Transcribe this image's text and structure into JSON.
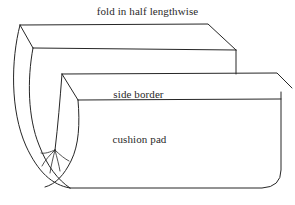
{
  "diagram": {
    "type": "line-illustration",
    "background_color": "#ffffff",
    "line_color": "#262626",
    "text_color": "#2a2a2a",
    "width": 295,
    "height": 205,
    "labels": {
      "fold": "fold in half lengthwise",
      "side_border": "side border",
      "cushion_pad": "cushion pad"
    },
    "parts": {
      "top_slab": "top slab",
      "side_border_strip": "side border strip",
      "cushion_pad_body": "cushion pad body",
      "folded_end": "folded U-shaped end",
      "crease_fan": "gathered crease lines"
    }
  }
}
